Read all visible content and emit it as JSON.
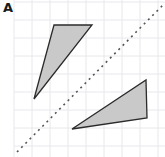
{
  "figure": {
    "width": 165,
    "height": 157,
    "background_color": "#ffffff",
    "panel_label": "A"
  },
  "chart_data": {
    "type": "scatter",
    "title": "A",
    "xlabel": "",
    "ylabel": "",
    "grid": true,
    "grid_color": "#e8e8ec",
    "grid_spacing_px": 18,
    "xlim": [
      0,
      165
    ],
    "ylim": [
      0,
      157
    ],
    "legend": "none",
    "annotations": [
      {
        "name": "panel-label",
        "text": "A",
        "x": 5,
        "y": 8
      }
    ],
    "series": [
      {
        "name": "triangle-upper-left",
        "type": "polygon",
        "fill": "#c9c9c9",
        "stroke": "#2b2b2b",
        "stroke_width": 1.3,
        "points": [
          [
            54,
            25
          ],
          [
            92,
            25
          ],
          [
            34,
            99
          ]
        ]
      },
      {
        "name": "triangle-lower-right",
        "type": "polygon",
        "fill": "#c9c9c9",
        "stroke": "#2b2b2b",
        "stroke_width": 1.3,
        "points": [
          [
            72,
            129
          ],
          [
            146,
            80
          ],
          [
            147,
            118
          ]
        ]
      },
      {
        "name": "mirror-line",
        "type": "line",
        "style": "dashed",
        "stroke": "#555555",
        "stroke_width": 1.6,
        "dash_pattern": "2 4",
        "points": [
          [
            17,
            152
          ],
          [
            165,
            3
          ]
        ]
      }
    ]
  }
}
